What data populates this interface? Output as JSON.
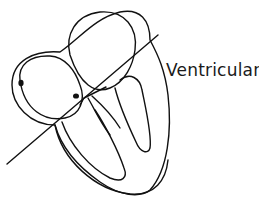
{
  "diagram": {
    "label": "Ventricular",
    "stroke_color": "#111111",
    "background_color": "#ffffff"
  }
}
